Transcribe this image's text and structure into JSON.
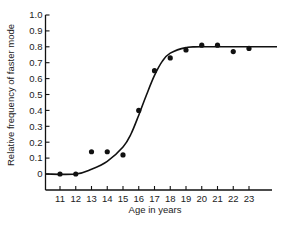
{
  "chart_data": {
    "type": "scatter",
    "title": "",
    "xlabel": "Age in years",
    "ylabel": "Relative frequency of faster mode",
    "x_ticks": [
      "11",
      "12",
      "13",
      "14",
      "15",
      "16",
      "17",
      "18",
      "19",
      "20",
      "21",
      "22",
      "23"
    ],
    "y_ticks": [
      "0",
      "0.1",
      "0.2",
      "0.3",
      "0.4",
      "0.5",
      "0.6",
      "0.7",
      "0.8",
      "0.9",
      "1.0"
    ],
    "xlim": [
      10.0,
      24.5
    ],
    "ylim": [
      0,
      1.0
    ],
    "grid": false,
    "legend": null,
    "series": [
      {
        "name": "Observed",
        "type": "scatter",
        "x": [
          11,
          12,
          13,
          14,
          15,
          16,
          17,
          18,
          19,
          20,
          21,
          22,
          23
        ],
        "y": [
          0.0,
          0.0,
          0.14,
          0.14,
          0.12,
          0.4,
          0.65,
          0.73,
          0.78,
          0.81,
          0.81,
          0.77,
          0.79
        ]
      },
      {
        "name": "Fitted sigmoid",
        "type": "line",
        "x": [
          10.0,
          12.0,
          13.0,
          14.0,
          15.0,
          15.5,
          16.0,
          16.5,
          17.0,
          17.5,
          18.0,
          19.0,
          20.0,
          24.5
        ],
        "y": [
          0.0,
          0.0,
          0.03,
          0.08,
          0.17,
          0.25,
          0.37,
          0.5,
          0.62,
          0.71,
          0.76,
          0.795,
          0.8,
          0.8
        ]
      }
    ]
  }
}
